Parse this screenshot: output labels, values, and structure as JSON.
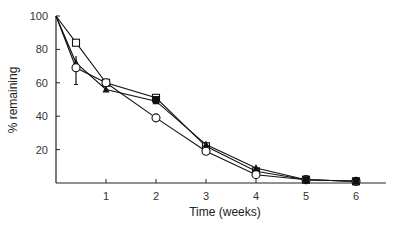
{
  "chart_data": {
    "type": "line",
    "title": "",
    "xlabel": "Time (weeks)",
    "ylabel": "% remaining",
    "xlim": [
      0,
      6.6
    ],
    "ylim": [
      0,
      100
    ],
    "xticks": [
      1,
      2,
      3,
      4,
      5,
      6
    ],
    "yticks": [
      20,
      40,
      60,
      80,
      100
    ],
    "grid": false,
    "legend": null,
    "series": [
      {
        "name": "open-square",
        "marker": "square-open",
        "points": [
          [
            0,
            100
          ],
          [
            0.4,
            84
          ],
          [
            1,
            60
          ],
          [
            2,
            51
          ],
          [
            3,
            22
          ],
          [
            4,
            7
          ],
          [
            5,
            2
          ],
          [
            6,
            1
          ]
        ]
      },
      {
        "name": "filled-triangle",
        "marker": "triangle-filled",
        "points": [
          [
            0,
            100
          ],
          [
            0.4,
            72
          ],
          [
            1,
            56
          ],
          [
            2,
            49
          ],
          [
            3,
            23
          ],
          [
            4,
            9
          ],
          [
            5,
            2
          ],
          [
            6,
            1
          ]
        ]
      },
      {
        "name": "open-circle",
        "marker": "circle-open",
        "points": [
          [
            0,
            100
          ],
          [
            0.4,
            69
          ],
          [
            1,
            60
          ],
          [
            2,
            39
          ],
          [
            3,
            19
          ],
          [
            4,
            5
          ],
          [
            5,
            2
          ],
          [
            6,
            1
          ]
        ],
        "error_bars": [
          [
            0.4,
            59,
            76
          ]
        ]
      },
      {
        "name": "filled-square",
        "marker": "square-filled",
        "points": [
          [
            2,
            50
          ],
          [
            5,
            2
          ],
          [
            6,
            1
          ]
        ]
      }
    ],
    "colors": {
      "line": "#111111",
      "axis": "#222222"
    }
  }
}
